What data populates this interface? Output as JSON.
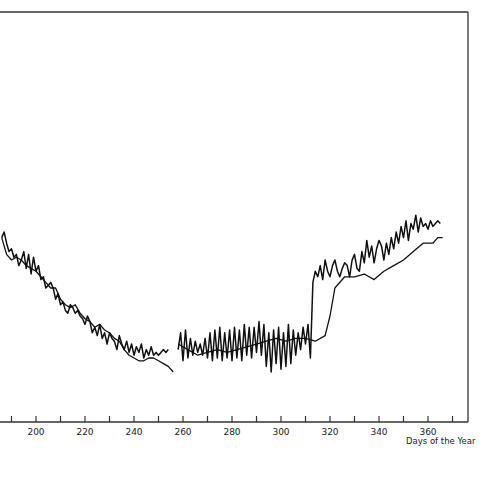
{
  "chart_data": {
    "type": "line",
    "title": "",
    "xlabel": "Days of the Year",
    "ylabel": "",
    "xlim": [
      186,
      376
    ],
    "ylim": [
      0,
      100
    ],
    "grid": false,
    "legend": null,
    "x_ticks": [
      190,
      200,
      210,
      220,
      230,
      240,
      250,
      260,
      270,
      280,
      290,
      300,
      310,
      320,
      330,
      340,
      350,
      360,
      370
    ],
    "x_tick_labels": [
      "200",
      "220",
      "240",
      "260",
      "280",
      "300",
      "320",
      "340",
      "360"
    ],
    "x_tick_label_values": [
      200,
      220,
      240,
      260,
      280,
      300,
      320,
      340,
      360
    ],
    "series": [
      {
        "name": "Series A (jagged daily)",
        "segments": [
          {
            "x": [
              186,
              187,
              188,
              189,
              190,
              191,
              192,
              193,
              194,
              195,
              196,
              197,
              198,
              199,
              200,
              201,
              202,
              203,
              204,
              205,
              206,
              207,
              208,
              209,
              210,
              211,
              212,
              213,
              214,
              215,
              216,
              217,
              218,
              219,
              220,
              221,
              222,
              223,
              224,
              225,
              226,
              227,
              228,
              229,
              230,
              231,
              232,
              233,
              234,
              235,
              236,
              237,
              238,
              239,
              240,
              241,
              242,
              243,
              244,
              245,
              246,
              247,
              248,
              249,
              250,
              251,
              252,
              253,
              254
            ],
            "y": [
              58,
              60,
              56,
              53,
              54,
              51,
              52,
              48,
              50,
              53,
              47,
              52,
              45,
              51,
              46,
              48,
              43,
              44,
              40,
              41,
              42,
              40,
              36,
              38,
              34,
              35,
              32,
              31,
              34,
              33,
              31,
              32,
              30,
              29,
              27,
              30,
              28,
              24,
              26,
              23,
              27,
              22,
              24,
              20,
              24,
              22,
              21,
              18,
              23,
              20,
              18,
              21,
              17,
              20,
              16,
              19,
              17,
              20,
              15,
              18,
              16,
              19,
              16,
              17,
              16,
              17,
              18,
              17,
              18
            ]
          },
          {
            "x": [
              258,
              259,
              260,
              261,
              262,
              263,
              264,
              265,
              266,
              267,
              268,
              269,
              270,
              271,
              272,
              273,
              274,
              275,
              276,
              277,
              278,
              279,
              280,
              281,
              282,
              283,
              284,
              285,
              286,
              287,
              288,
              289,
              290,
              291,
              292,
              293,
              294,
              295,
              296,
              297,
              298,
              299,
              300,
              301,
              302,
              303,
              304,
              305,
              306,
              307,
              308,
              309,
              310,
              311,
              312,
              313,
              314,
              315,
              316,
              317,
              318,
              319,
              320,
              321,
              322,
              323,
              324,
              325,
              326,
              327,
              328,
              329,
              330,
              331,
              332,
              333,
              334,
              335,
              336,
              337,
              338,
              339,
              340,
              341,
              342,
              343,
              344,
              345,
              346,
              347,
              348,
              349,
              350,
              351,
              352,
              353,
              354,
              355,
              356,
              357,
              358,
              359,
              360,
              361,
              362,
              363,
              364,
              365
            ],
            "y": [
              18,
              24,
              14,
              25,
              15,
              22,
              16,
              21,
              17,
              20,
              16,
              22,
              15,
              24,
              14,
              25,
              15,
              26,
              14,
              24,
              15,
              25,
              14,
              26,
              15,
              25,
              14,
              27,
              16,
              26,
              15,
              26,
              17,
              28,
              16,
              27,
              12,
              24,
              10,
              25,
              13,
              26,
              11,
              24,
              12,
              27,
              13,
              25,
              16,
              24,
              18,
              26,
              20,
              27,
              15,
              42,
              46,
              44,
              48,
              43,
              50,
              46,
              44,
              48,
              50,
              46,
              44,
              47,
              49,
              48,
              44,
              50,
              52,
              47,
              46,
              53,
              49,
              57,
              51,
              55,
              49,
              54,
              57,
              55,
              50,
              56,
              52,
              58,
              54,
              60,
              56,
              62,
              58,
              64,
              57,
              63,
              61,
              66,
              60,
              65,
              62,
              63,
              61,
              64,
              62,
              63,
              64,
              63
            ]
          }
        ]
      },
      {
        "name": "Series B (smoothed)",
        "segments": [
          {
            "x": [
              186,
              188,
              190,
              192,
              194,
              196,
              198,
              200,
              202,
              204,
              206,
              208,
              210,
              212,
              214,
              216,
              218,
              220,
              222,
              224,
              226,
              228,
              230,
              232,
              234,
              236,
              238,
              240,
              242,
              244,
              246,
              248,
              250,
              252,
              254,
              256
            ],
            "y": [
              58,
              52,
              50,
              51,
              50,
              48,
              47,
              46,
              44,
              42,
              40,
              40,
              36,
              34,
              33,
              34,
              31,
              29,
              28,
              26,
              27,
              25,
              24,
              22,
              21,
              18,
              16,
              15,
              14,
              14,
              15,
              15,
              14,
              13,
              12,
              10
            ]
          },
          {
            "x": [
              258,
              262,
              266,
              270,
              274,
              278,
              282,
              286,
              290,
              294,
              298,
              302,
              306,
              310,
              314,
              318,
              320,
              322,
              326,
              330,
              334,
              338,
              342,
              346,
              350,
              354,
              358,
              362,
              364,
              366
            ],
            "y": [
              20,
              18,
              16,
              17,
              18,
              17,
              18,
              19,
              20,
              21,
              22,
              21,
              22,
              22,
              21,
              23,
              30,
              40,
              44,
              44,
              45,
              43,
              46,
              48,
              50,
              53,
              56,
              56,
              58,
              58
            ]
          }
        ]
      }
    ]
  },
  "axis": {
    "x_tick_labels": [
      "200",
      "220",
      "240",
      "260",
      "280",
      "300",
      "320",
      "340",
      "360"
    ],
    "x_title": "Days of the Year"
  }
}
